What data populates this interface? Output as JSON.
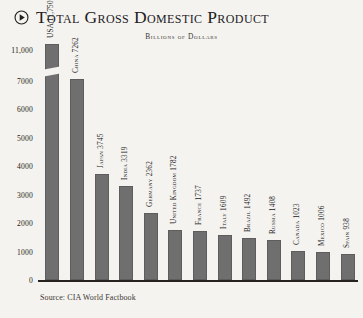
{
  "header": {
    "icon": "play-circle-icon",
    "title": "Total Gross Domestic Product",
    "subtitle": "Billions of Dollars"
  },
  "footer": {
    "source": "Source: CIA World Factbook"
  },
  "style": {
    "background": "#f4f3ef",
    "bar_color": "#6f6f6f",
    "axis_color": "#262320",
    "text_color": "#23201d"
  },
  "chart_data": {
    "type": "bar",
    "title": "Total Gross Domestic Product",
    "subtitle": "Billions of Dollars",
    "xlabel": "",
    "ylabel": "",
    "ylim": [
      0,
      11750
    ],
    "grid": false,
    "legend": null,
    "axis_break": {
      "present": true,
      "between": [
        7000,
        11000
      ],
      "note": "y-axis compressed above 7000; USA bar drawn with break mark"
    },
    "ytick_labels": [
      "11,000",
      "7000",
      "6000",
      "5000",
      "4000",
      "3000",
      "2000",
      "1000",
      "0"
    ],
    "ytick_values": [
      11000,
      7000,
      6000,
      5000,
      4000,
      3000,
      2000,
      1000,
      0
    ],
    "categories": [
      "USA",
      "China",
      "Japan",
      "India",
      "Germany",
      "United Kingdom",
      "France",
      "Italy",
      "Brazil",
      "Russia",
      "Canada",
      "Mexico",
      "Spain"
    ],
    "values": [
      11750,
      7262,
      3745,
      3319,
      2362,
      1782,
      1737,
      1609,
      1492,
      1408,
      1023,
      1006,
      938
    ],
    "bar_labels": [
      "USA 11,750",
      "China 7262",
      "Japan 3745",
      "India 3319",
      "Germany 2362",
      "United Kingdom 1782",
      "France 1737",
      "Italy 1609",
      "Brazil 1492",
      "Russia 1408",
      "Canada 1023",
      "Mexico 1006",
      "Spain 938"
    ],
    "source": "Source: CIA World Factbook"
  }
}
